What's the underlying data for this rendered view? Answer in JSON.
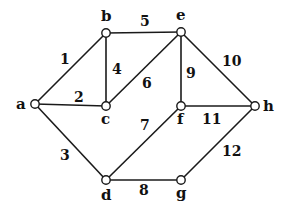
{
  "nodes": [
    {
      "id": "a",
      "label": "a",
      "x": 35,
      "y": 104,
      "lx": 16,
      "ly": 109
    },
    {
      "id": "b",
      "label": "b",
      "x": 106,
      "y": 33,
      "lx": 101,
      "ly": 21
    },
    {
      "id": "e",
      "label": "e",
      "x": 181,
      "y": 32,
      "lx": 176,
      "ly": 20
    },
    {
      "id": "c",
      "label": "c",
      "x": 106,
      "y": 106,
      "lx": 101,
      "ly": 124
    },
    {
      "id": "f",
      "label": "f",
      "x": 181,
      "y": 106,
      "lx": 177,
      "ly": 124
    },
    {
      "id": "h",
      "label": "h",
      "x": 255,
      "y": 106,
      "lx": 263,
      "ly": 111
    },
    {
      "id": "d",
      "label": "d",
      "x": 106,
      "y": 180,
      "lx": 101,
      "ly": 200
    },
    {
      "id": "g",
      "label": "g",
      "x": 181,
      "y": 180,
      "lx": 176,
      "ly": 198
    }
  ],
  "edges": [
    {
      "from": "a",
      "to": "b",
      "weight": "1",
      "lx": 60,
      "ly": 64
    },
    {
      "from": "a",
      "to": "c",
      "weight": "2",
      "lx": 74,
      "ly": 102
    },
    {
      "from": "a",
      "to": "d",
      "weight": "3",
      "lx": 60,
      "ly": 160
    },
    {
      "from": "b",
      "to": "c",
      "weight": "4",
      "lx": 112,
      "ly": 74
    },
    {
      "from": "b",
      "to": "e",
      "weight": "5",
      "lx": 140,
      "ly": 26
    },
    {
      "from": "c",
      "to": "e",
      "weight": "6",
      "lx": 142,
      "ly": 88
    },
    {
      "from": "d",
      "to": "f",
      "weight": "7",
      "lx": 140,
      "ly": 130
    },
    {
      "from": "d",
      "to": "g",
      "weight": "8",
      "lx": 139,
      "ly": 195
    },
    {
      "from": "e",
      "to": "f",
      "weight": "9",
      "lx": 186,
      "ly": 78
    },
    {
      "from": "e",
      "to": "h",
      "weight": "10",
      "lx": 222,
      "ly": 66
    },
    {
      "from": "f",
      "to": "h",
      "weight": "11",
      "lx": 202,
      "ly": 124
    },
    {
      "from": "g",
      "to": "h",
      "weight": "12",
      "lx": 222,
      "ly": 156
    }
  ],
  "colors": {
    "line": "#1a1a1a",
    "background": "#ffffff"
  }
}
